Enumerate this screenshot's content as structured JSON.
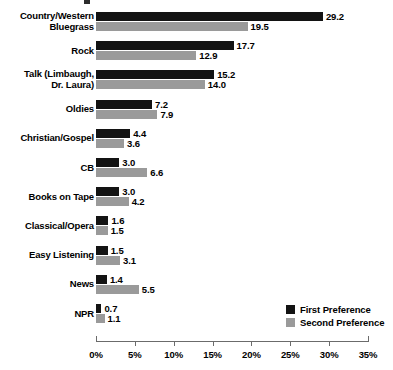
{
  "chart_data": {
    "type": "bar",
    "orientation": "horizontal",
    "title": "",
    "xlabel": "",
    "ylabel": "",
    "xlim": [
      0,
      35
    ],
    "xtick_labels": [
      "0%",
      "5%",
      "10%",
      "15%",
      "20%",
      "25%",
      "30%",
      "35%"
    ],
    "xtick_values": [
      0,
      5,
      10,
      15,
      20,
      25,
      30,
      35
    ],
    "grid": false,
    "legend_position": "bottom-right",
    "categories": [
      "Country/Western\nBluegrass",
      "Rock",
      "Talk (Limbaugh,\nDr. Laura)",
      "Oldies",
      "Christian/Gospel",
      "CB",
      "Books on Tape",
      "Classical/Opera",
      "Easy Listening",
      "News",
      "NPR"
    ],
    "series": [
      {
        "name": "First Preference",
        "color": "#131313",
        "values": [
          29.2,
          17.7,
          15.2,
          7.2,
          4.4,
          3.0,
          3.0,
          1.6,
          1.5,
          1.4,
          0.7
        ],
        "value_labels": [
          "29.2",
          "17.7",
          "15.2",
          "7.2",
          "4.4",
          "3.0",
          "3.0",
          "1.6",
          "1.5",
          "1.4",
          "0.7"
        ]
      },
      {
        "name": "Second Preference",
        "color": "#9a9a9a",
        "values": [
          19.5,
          12.9,
          14.0,
          7.9,
          3.6,
          6.6,
          4.2,
          1.5,
          3.1,
          5.5,
          1.1
        ],
        "value_labels": [
          "19.5",
          "12.9",
          "14.0",
          "7.9",
          "3.6",
          "6.6",
          "4.2",
          "1.5",
          "3.1",
          "5.5",
          "1.1"
        ]
      }
    ]
  },
  "legend": {
    "items": [
      {
        "label": "First Preference",
        "color": "#131313"
      },
      {
        "label": "Second Preference",
        "color": "#9a9a9a"
      }
    ]
  },
  "axis": {
    "ticks": [
      "0%",
      "5%",
      "10%",
      "15%",
      "20%",
      "25%",
      "30%",
      "35%"
    ]
  }
}
